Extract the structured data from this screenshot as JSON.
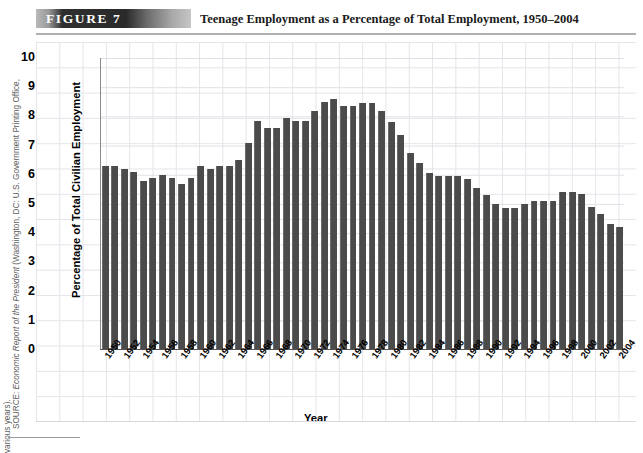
{
  "header": {
    "badge_label": "FIGURE  7",
    "title": "Teenage Employment as a Percentage of Total Employment, 1950–2004"
  },
  "source": {
    "label": "SOURCE: ",
    "italic_part": "Economic Report of the President",
    "rest": " (Washington, DC: U.S. Government Printing Office,",
    "line2": "various years)."
  },
  "chart_data": {
    "type": "bar",
    "title": "Teenage Employment as a Percentage of Total Employment, 1950–2004",
    "xlabel": "Year",
    "ylabel": "Percentage of Total Civilian Employment",
    "ylim": [
      0,
      10
    ],
    "yticks": [
      0,
      1,
      2,
      3,
      4,
      5,
      6,
      7,
      8,
      9,
      10
    ],
    "ytick_labels": [
      "0",
      "1",
      "2",
      "3",
      "4",
      "5",
      "6",
      "7",
      "8",
      "9",
      "10"
    ],
    "xtick_labels": [
      "1950",
      "1952",
      "1954",
      "1956",
      "1958",
      "1960",
      "1962",
      "1964",
      "1966",
      "1968",
      "1970",
      "1972",
      "1974",
      "1976",
      "1978",
      "1980",
      "1982",
      "1984",
      "1986",
      "1988",
      "1990",
      "1992",
      "1994",
      "1996",
      "1998",
      "2000",
      "2002",
      "2004"
    ],
    "xtick_interval": 2,
    "grid": true,
    "legend": "none",
    "bar_color": "#4b4b4b",
    "categories": [
      1950,
      1951,
      1952,
      1953,
      1954,
      1955,
      1956,
      1957,
      1958,
      1959,
      1960,
      1961,
      1962,
      1963,
      1964,
      1965,
      1966,
      1967,
      1968,
      1969,
      1970,
      1971,
      1972,
      1973,
      1974,
      1975,
      1976,
      1977,
      1978,
      1979,
      1980,
      1981,
      1982,
      1983,
      1984,
      1985,
      1986,
      1987,
      1988,
      1989,
      1990,
      1991,
      1992,
      1993,
      1994,
      1995,
      1996,
      1997,
      1998,
      1999,
      2000,
      2001,
      2002,
      2003,
      2004
    ],
    "values": [
      6.3,
      6.3,
      6.2,
      6.1,
      5.8,
      5.9,
      6.0,
      5.9,
      5.7,
      5.9,
      6.3,
      6.2,
      6.3,
      6.3,
      6.5,
      7.1,
      7.85,
      7.6,
      7.6,
      7.95,
      7.85,
      7.85,
      8.2,
      8.5,
      8.6,
      8.35,
      8.35,
      8.45,
      8.45,
      8.2,
      7.8,
      7.35,
      6.75,
      6.4,
      6.05,
      5.95,
      5.95,
      5.95,
      5.85,
      5.55,
      5.3,
      5.0,
      4.85,
      4.85,
      5.0,
      5.1,
      5.1,
      5.1,
      5.4,
      5.4,
      5.35,
      4.9,
      4.65,
      4.3,
      4.2
    ]
  }
}
